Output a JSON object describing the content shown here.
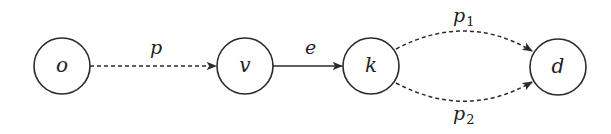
{
  "diagram": {
    "type": "directed-graph",
    "nodes": [
      {
        "id": "o",
        "label": "o",
        "cx": 62,
        "cy": 66,
        "r": 28
      },
      {
        "id": "v",
        "label": "v",
        "cx": 245,
        "cy": 66,
        "r": 28
      },
      {
        "id": "k",
        "label": "k",
        "cx": 371,
        "cy": 66,
        "r": 28
      },
      {
        "id": "d",
        "label": "d",
        "cx": 558,
        "cy": 67,
        "r": 28
      }
    ],
    "edges": [
      {
        "from": "o",
        "to": "v",
        "label": "p",
        "subscript": "",
        "style": "dashed"
      },
      {
        "from": "v",
        "to": "k",
        "label": "e",
        "subscript": "",
        "style": "solid"
      },
      {
        "from": "k",
        "to": "d",
        "label": "p",
        "subscript": "1",
        "style": "dashed",
        "curve": "upper"
      },
      {
        "from": "k",
        "to": "d",
        "label": "p",
        "subscript": "2",
        "style": "dashed",
        "curve": "lower"
      }
    ],
    "colors": {
      "stroke": "#2b2b2b",
      "text": "#222222",
      "background": "#ffffff"
    }
  }
}
